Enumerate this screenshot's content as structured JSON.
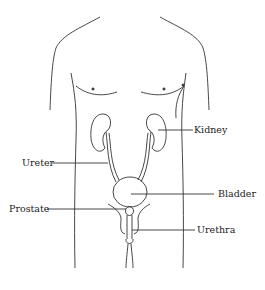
{
  "diagram": {
    "labels": {
      "kidney": "Kidney",
      "ureter": "Ureter",
      "bladder": "Bladder",
      "prostate": "Prostate",
      "urethra": "Urethra"
    },
    "colors": {
      "stroke": "#333333",
      "text": "#222222",
      "background": "#ffffff"
    }
  }
}
